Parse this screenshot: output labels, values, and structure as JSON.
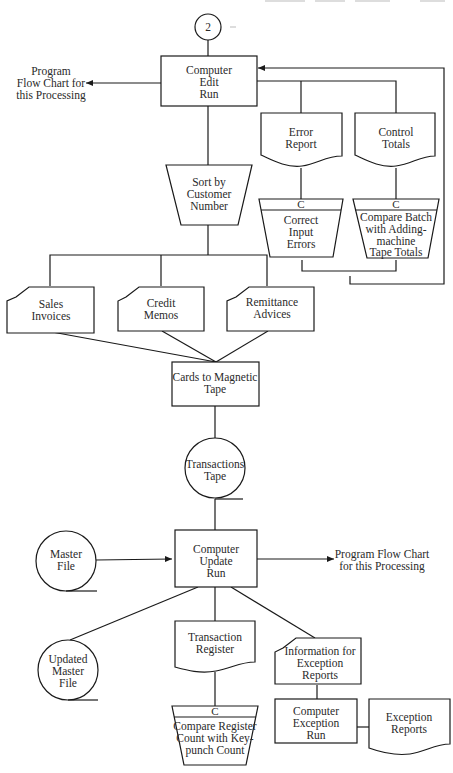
{
  "diagram": {
    "type": "system-flowchart",
    "connector": {
      "label": "2"
    },
    "edit_run": {
      "lines": [
        "Computer",
        "Edit",
        "Run"
      ]
    },
    "edit_program_note": {
      "lines": [
        "Program",
        "Flow Chart for",
        "this Processing"
      ]
    },
    "error_report": {
      "lines": [
        "Error",
        "Report"
      ]
    },
    "control_totals": {
      "lines": [
        "Control",
        "Totals"
      ]
    },
    "correct_errors": {
      "badge": "C",
      "lines": [
        "Correct",
        "Input",
        "Errors"
      ]
    },
    "compare_batch": {
      "badge": "C",
      "lines": [
        "Compare Batch",
        "with Adding-",
        "machine",
        "Tape Totals"
      ]
    },
    "sort": {
      "lines": [
        "Sort by",
        "Customer",
        "Number"
      ]
    },
    "sales_invoices": {
      "lines": [
        "Sales",
        "Invoices"
      ]
    },
    "credit_memos": {
      "lines": [
        "Credit",
        "Memos"
      ]
    },
    "remittance_advices": {
      "lines": [
        "Remittance",
        "Advices"
      ]
    },
    "cards_to_tape": {
      "lines": [
        "Cards to Magnetic",
        "Tape"
      ]
    },
    "transactions_tape": {
      "lines": [
        "Transactions",
        "Tape"
      ]
    },
    "master_file": {
      "lines": [
        "Master",
        "File"
      ]
    },
    "update_run": {
      "lines": [
        "Computer",
        "Update",
        "Run"
      ]
    },
    "update_program_note": {
      "lines": [
        "Program Flow Chart",
        "for this Processing"
      ]
    },
    "updated_master": {
      "lines": [
        "Updated",
        "Master",
        "File"
      ]
    },
    "transaction_register": {
      "lines": [
        "Transaction",
        "Register"
      ]
    },
    "compare_register": {
      "badge": "C",
      "lines": [
        "Compare Register",
        "Count with Key-",
        "punch Count"
      ]
    },
    "exception_info": {
      "lines": [
        "Information for",
        "Exception",
        "Reports"
      ]
    },
    "exception_run": {
      "lines": [
        "Computer",
        "Exception",
        "Run"
      ]
    },
    "exception_reports": {
      "lines": [
        "Exception",
        "Reports"
      ]
    }
  }
}
